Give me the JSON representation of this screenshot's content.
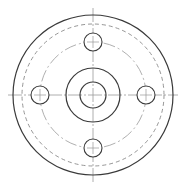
{
  "drawing": {
    "type": "flange-plan-view",
    "center": [
      93,
      95
    ],
    "colors": {
      "solid": "#3a3a3a",
      "dashed": "#8a8a8a",
      "centerline": "#9a9a9a",
      "background": "#ffffff"
    },
    "outer_circle_r": 80,
    "hidden_circle_r": 71,
    "bolt_circle_r": 53,
    "hub_outer_r": 27,
    "bore_r": 13,
    "bolt_holes": {
      "count": 4,
      "radius": 9,
      "angles_deg": [
        0,
        90,
        180,
        270
      ]
    },
    "centerlines": {
      "horizontal": [
        8,
        178
      ],
      "vertical": [
        8,
        183
      ]
    }
  }
}
